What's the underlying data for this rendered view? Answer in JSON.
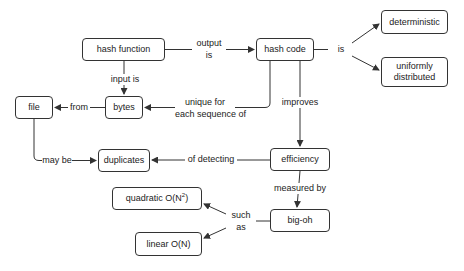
{
  "diagram": {
    "type": "concept-map",
    "colors": {
      "stroke": "#333333",
      "text": "#222222",
      "background": "#ffffff"
    },
    "nodes": {
      "hash_function": "hash function",
      "hash_code": "hash code",
      "deterministic": "deterministic",
      "uniformly_distributed_line1": "uniformly",
      "uniformly_distributed_line2": "distributed",
      "file": "file",
      "bytes": "bytes",
      "duplicates": "duplicates",
      "efficiency": "efficiency",
      "big_oh": "big-oh",
      "quadratic_prefix": "quadratic O(N",
      "quadratic_exp": "2",
      "quadratic_suffix": ")",
      "linear": "linear O(N)"
    },
    "edges": {
      "output_is_line1": "output",
      "output_is_line2": "is",
      "is": "is",
      "input_is": "input is",
      "from": "from",
      "unique_line1": "unique for",
      "unique_line2": "each sequence of",
      "improves": "improves",
      "may_be": "may be",
      "of_detecting": "of detecting",
      "measured_by": "measured by",
      "such_as_line1": "such",
      "such_as_line2": "as"
    },
    "relations": [
      {
        "from": "hash function",
        "label": "output is",
        "to": "hash code"
      },
      {
        "from": "hash code",
        "label": "is",
        "to": "deterministic"
      },
      {
        "from": "hash code",
        "label": "is",
        "to": "uniformly distributed"
      },
      {
        "from": "hash function",
        "label": "input is",
        "to": "bytes"
      },
      {
        "from": "bytes",
        "label": "from",
        "to": "file"
      },
      {
        "from": "hash code",
        "label": "unique for each sequence of",
        "to": "bytes"
      },
      {
        "from": "hash code",
        "label": "improves",
        "to": "efficiency"
      },
      {
        "from": "file",
        "label": "may be",
        "to": "duplicates"
      },
      {
        "from": "efficiency",
        "label": "of detecting",
        "to": "duplicates"
      },
      {
        "from": "efficiency",
        "label": "measured by",
        "to": "big-oh"
      },
      {
        "from": "big-oh",
        "label": "such as",
        "to": "quadratic O(N^2)"
      },
      {
        "from": "big-oh",
        "label": "such as",
        "to": "linear O(N)"
      }
    ]
  }
}
